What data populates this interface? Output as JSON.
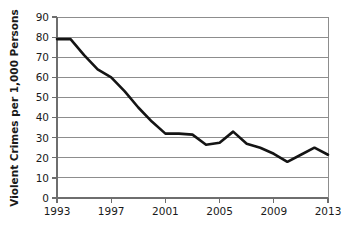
{
  "chart_data": {
    "type": "line",
    "title": "",
    "xlabel": "",
    "ylabel": "Violent Crimes per 1,000 Persons",
    "x": [
      1993,
      1994,
      1995,
      1996,
      1997,
      1998,
      1999,
      2000,
      2001,
      2002,
      2003,
      2004,
      2005,
      2006,
      2007,
      2008,
      2009,
      2010,
      2011,
      2012,
      2013
    ],
    "values": [
      79,
      79,
      71,
      64,
      60,
      53,
      45,
      38,
      32,
      32,
      31.5,
      26.5,
      27.5,
      33,
      27,
      25,
      22,
      18,
      21.5,
      25,
      21.5
    ],
    "series": [
      {
        "name": "Violent Crimes per 1,000 Persons",
        "values": [
          79,
          79,
          71,
          64,
          60,
          53,
          45,
          38,
          32,
          32,
          31.5,
          26.5,
          27.5,
          33,
          27,
          25,
          22,
          18,
          21.5,
          25,
          21.5
        ],
        "color": "#141414"
      }
    ],
    "xlim": [
      1993,
      2013
    ],
    "ylim": [
      0,
      90
    ],
    "y_ticks": [
      0,
      10,
      20,
      30,
      40,
      50,
      60,
      70,
      80,
      90
    ],
    "y_tick_labels": [
      "0",
      "10",
      "20",
      "30",
      "40",
      "50",
      "60",
      "70",
      "80",
      "90"
    ],
    "x_ticks": [
      1993,
      1997,
      2001,
      2005,
      2009,
      2013
    ],
    "x_tick_labels": [
      "1993",
      "1997",
      "2001",
      "2005",
      "2009",
      "2013"
    ],
    "grid": true,
    "grid_axis": "y",
    "legend": false,
    "legend_position": "none",
    "annotations": [],
    "line_color": "#141414",
    "grid_color": "#8d8d8d",
    "background_color": "#ffffff"
  },
  "axis_titles": {
    "y": "Violent Crimes per 1,000 Persons",
    "x": ""
  }
}
